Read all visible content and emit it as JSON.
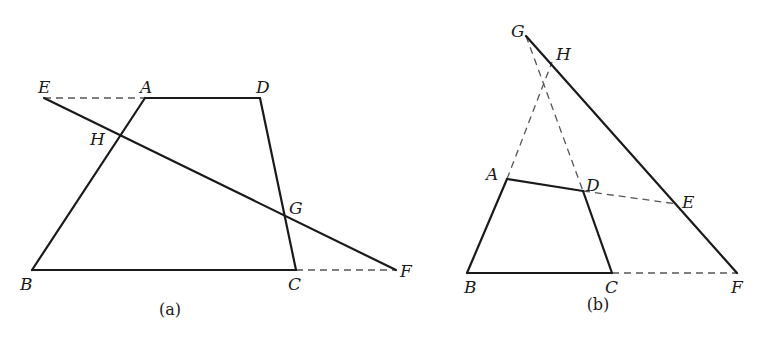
{
  "figures": [
    {
      "id": "a",
      "caption": "(a)",
      "points": {
        "A": [
          145,
          98
        ],
        "B": [
          32,
          270
        ],
        "C": [
          296,
          270
        ],
        "D": [
          260,
          98
        ],
        "E": [
          44,
          98
        ],
        "F": [
          396,
          270
        ],
        "G": [
          286,
          218
        ],
        "H": [
          118,
          139
        ]
      },
      "labels": {
        "A": {
          "text": "A",
          "x": 140,
          "y": 93
        },
        "B": {
          "text": "B",
          "x": 20,
          "y": 290
        },
        "C": {
          "text": "C",
          "x": 288,
          "y": 290
        },
        "D": {
          "text": "D",
          "x": 256,
          "y": 93
        },
        "E": {
          "text": "E",
          "x": 38,
          "y": 93
        },
        "F": {
          "text": "F",
          "x": 400,
          "y": 277
        },
        "G": {
          "text": "G",
          "x": 289,
          "y": 214
        },
        "H": {
          "text": "H",
          "x": 90,
          "y": 145
        }
      },
      "solid_segments": [
        [
          "A",
          "D"
        ],
        [
          "D",
          "C"
        ],
        [
          "C",
          "B"
        ],
        [
          "B",
          "A"
        ],
        [
          "E",
          "F"
        ]
      ],
      "dashed_segments": [
        [
          "E",
          "A"
        ],
        [
          "C",
          "F"
        ]
      ],
      "caption_pos": [
        170,
        315
      ]
    },
    {
      "id": "b",
      "caption": "(b)",
      "points": {
        "A": [
          507,
          179
        ],
        "B": [
          467,
          273
        ],
        "C": [
          612,
          273
        ],
        "D": [
          583,
          191
        ],
        "E": [
          677,
          204
        ],
        "F": [
          737,
          273
        ],
        "G": [
          526,
          36
        ],
        "H": [
          552,
          62
        ]
      },
      "labels": {
        "A": {
          "text": "A",
          "x": 486,
          "y": 180
        },
        "B": {
          "text": "B",
          "x": 464,
          "y": 293
        },
        "C": {
          "text": "C",
          "x": 605,
          "y": 293
        },
        "D": {
          "text": "D",
          "x": 586,
          "y": 191
        },
        "E": {
          "text": "E",
          "x": 682,
          "y": 208
        },
        "F": {
          "text": "F",
          "x": 731,
          "y": 293
        },
        "G": {
          "text": "G",
          "x": 511,
          "y": 37
        },
        "H": {
          "text": "H",
          "x": 556,
          "y": 60
        }
      },
      "solid_segments": [
        [
          "A",
          "D"
        ],
        [
          "D",
          "C"
        ],
        [
          "C",
          "B"
        ],
        [
          "B",
          "A"
        ],
        [
          "G",
          "F"
        ]
      ],
      "dashed_segments": [
        [
          "A",
          "H"
        ],
        [
          "G",
          "D"
        ],
        [
          "D",
          "E"
        ],
        [
          "C",
          "F"
        ]
      ],
      "caption_pos": [
        598,
        310
      ]
    }
  ]
}
